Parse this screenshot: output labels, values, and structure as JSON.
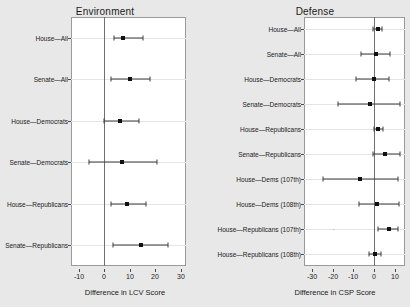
{
  "figure": {
    "background_color": "#e8e8e8",
    "panel_background": "#ffffff",
    "point_color": "#111111"
  },
  "chart_data": [
    {
      "type": "scatter",
      "title": "Environment",
      "xlabel": "Difference in LCV Score",
      "ylabel": "",
      "xlim": [
        -13,
        32
      ],
      "xticks": [
        -10,
        0,
        10,
        20,
        30
      ],
      "xtick_labels": [
        "-10",
        "0",
        "10",
        "20",
        "30"
      ],
      "grid": true,
      "legend": "none",
      "reference_line": 0,
      "categories": [
        "House—All",
        "Senate—All",
        "House—Democrats",
        "Senate—Democrats",
        "House—Republicans",
        "Senate—Republicans"
      ],
      "points": [
        {
          "label": "House—All",
          "estimate": 7.5,
          "low": 4.0,
          "high": 15.0
        },
        {
          "label": "Senate—All",
          "estimate": 10.0,
          "low": 2.5,
          "high": 18.0
        },
        {
          "label": "House—Democrats",
          "estimate": 6.0,
          "low": 0.0,
          "high": 13.5
        },
        {
          "label": "Senate—Democrats",
          "estimate": 7.0,
          "low": -6.0,
          "high": 20.5
        },
        {
          "label": "House—Republicans",
          "estimate": 9.0,
          "low": 2.5,
          "high": 16.5
        },
        {
          "label": "Senate—Republicans",
          "estimate": 14.5,
          "low": 3.5,
          "high": 25.0
        }
      ]
    },
    {
      "type": "scatter",
      "title": "Defense",
      "xlabel": "Difference in CSP Score",
      "ylabel": "",
      "xlim": [
        -34,
        15
      ],
      "xticks": [
        -30,
        -20,
        -10,
        0,
        10
      ],
      "xtick_labels": [
        "-30",
        "-20",
        "-10",
        "0",
        "10"
      ],
      "grid": true,
      "legend": "none",
      "reference_line": 0,
      "categories": [
        "House—All",
        "Senate—All",
        "House—Democrats",
        "Senate—Democrats",
        "House—Republicans",
        "Senate—Republicans",
        "House—Dems (107th)",
        "House—Dems (108th)",
        "House—Republicans (107th)",
        "House—Republicans (108th)"
      ],
      "points": [
        {
          "label": "House—All",
          "estimate": 1.8,
          "low": -0.4,
          "high": 4.0
        },
        {
          "label": "Senate—All",
          "estimate": 0.7,
          "low": -6.3,
          "high": 7.6
        },
        {
          "label": "House—Democrats",
          "estimate": -0.2,
          "low": -8.6,
          "high": 7.2
        },
        {
          "label": "Senate—Democrats",
          "estimate": -2.0,
          "low": -17.5,
          "high": 12.8
        },
        {
          "label": "House—Republicans",
          "estimate": 2.1,
          "low": 0.2,
          "high": 4.2
        },
        {
          "label": "Senate—Republicans",
          "estimate": 5.2,
          "low": -0.6,
          "high": 12.4
        },
        {
          "label": "House—Dems (107th)",
          "estimate": -7.0,
          "low": -25.0,
          "high": 11.4
        },
        {
          "label": "House—Dems (108th)",
          "estimate": 1.6,
          "low": -7.5,
          "high": 11.9
        },
        {
          "label": "House—Republicans (107th)",
          "estimate": 7.0,
          "low": 1.9,
          "high": 11.8
        },
        {
          "label": "House—Republicans (108th)",
          "estimate": 0.5,
          "low": -2.4,
          "high": 3.4
        }
      ]
    }
  ]
}
